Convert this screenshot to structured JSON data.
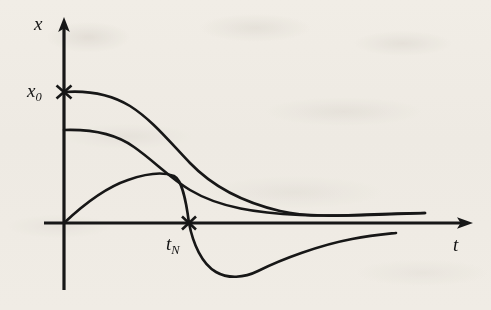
{
  "figure": {
    "kind": "line-plot-sketch",
    "background_color": "#f7f5f1",
    "ink_color": "#171717",
    "axes": {
      "vertical": {
        "label": "x",
        "name": "x-axis",
        "arrow": "up"
      },
      "horizontal": {
        "label": "t",
        "name": "t-axis",
        "arrow": "right"
      }
    },
    "tick_marks": [
      {
        "name": "x0-tick",
        "label_html": "x<sub>0</sub>",
        "label_text": "x0",
        "axis": "vertical",
        "glyph": "cross"
      },
      {
        "name": "tn-tick",
        "label_html": "t<sub>N</sub>",
        "label_text": "tN",
        "axis": "horizontal",
        "glyph": "cross"
      }
    ]
  },
  "chart_data": {
    "type": "line",
    "title": "",
    "subtitle": "",
    "xlabel": "t",
    "ylabel": "x",
    "grid": false,
    "legend": null,
    "axis_style": "arrow-axes-hand-drawn",
    "xlim": [
      0,
      1.0
    ],
    "ylim": [
      -0.45,
      1.15
    ],
    "annotations": [
      {
        "text": "x0",
        "display": "x₀",
        "at": [
          0,
          1.0
        ],
        "marker": "cross",
        "role": "initial-value-tick"
      },
      {
        "text": "tN",
        "display": "t_N",
        "at": [
          0.345,
          0
        ],
        "marker": "cross",
        "role": "zero-crossing-tick"
      }
    ],
    "series": [
      {
        "name": "curve-1-monotone-decay",
        "description": "starts at x0, decays monotonically toward zero",
        "x": [
          0.0,
          0.05,
          0.12,
          0.2,
          0.28,
          0.36,
          0.44,
          0.52,
          0.6,
          0.68,
          0.76,
          0.84,
          0.9,
          1.0
        ],
        "y": [
          1.0,
          1.0,
          0.97,
          0.9,
          0.8,
          0.67,
          0.54,
          0.41,
          0.3,
          0.21,
          0.14,
          0.09,
          0.07,
          0.06
        ]
      },
      {
        "name": "curve-2-lower-decay",
        "description": "starts below x0, decays monotonically toward zero, merges with curve 1",
        "x": [
          0.0,
          0.06,
          0.14,
          0.22,
          0.3,
          0.38,
          0.46,
          0.54,
          0.62,
          0.7,
          0.78,
          0.86,
          1.0
        ],
        "y": [
          0.72,
          0.72,
          0.68,
          0.61,
          0.52,
          0.43,
          0.35,
          0.28,
          0.21,
          0.15,
          0.11,
          0.08,
          0.06
        ]
      },
      {
        "name": "curve-3-overshoot-undershoot",
        "description": "starts at origin, rises to a positive peak, crosses zero at tN, dips negative, recovers toward zero",
        "x": [
          0.0,
          0.06,
          0.13,
          0.2,
          0.26,
          0.31,
          0.345,
          0.38,
          0.43,
          0.48,
          0.53,
          0.6,
          0.68,
          0.76,
          0.84
        ],
        "y": [
          0.0,
          0.16,
          0.28,
          0.34,
          0.35,
          0.22,
          0.0,
          -0.14,
          -0.26,
          -0.31,
          -0.3,
          -0.25,
          -0.18,
          -0.12,
          -0.08
        ]
      }
    ]
  }
}
